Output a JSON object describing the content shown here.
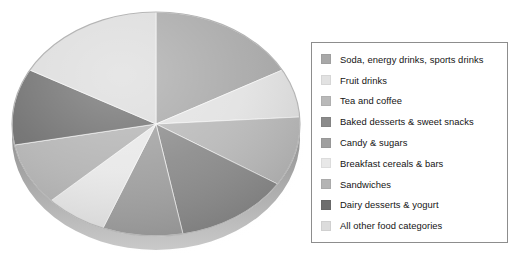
{
  "figure": {
    "background": "#ffffff"
  },
  "legend": {
    "name": "chart-legend",
    "position": "right",
    "border_color": "#8d8d8d",
    "items": [
      {
        "label": "Soda, energy drinks, sports drinks",
        "color": "#a8a8a8"
      },
      {
        "label": "Fruit drinks",
        "color": "#e2e2e2"
      },
      {
        "label": "Tea and coffee",
        "color": "#b9b9b9"
      },
      {
        "label": "Baked desserts & sweet snacks",
        "color": "#8b8b8b"
      },
      {
        "label": "Candy & sugars",
        "color": "#a0a0a0"
      },
      {
        "label": "Breakfast cereals & bars",
        "color": "#e8e8e8"
      },
      {
        "label": "Sandwiches",
        "color": "#b4b4b4"
      },
      {
        "label": "Dairy desserts & yogurt",
        "color": "#6e6e6e"
      },
      {
        "label": "All other food categories",
        "color": "#dcdcdc"
      }
    ]
  },
  "chart_data": {
    "type": "pie",
    "title": "",
    "subtitle": "",
    "xlabel": "",
    "ylabel": "",
    "grid": false,
    "legend_position": "right",
    "style": "3d-pie",
    "labels": [
      "Soda, energy drinks, sports drinks",
      "Fruit drinks",
      "Tea and coffee",
      "Baked desserts & sweet snacks",
      "Candy & sugars",
      "Breakfast cereals & bars",
      "Sandwiches",
      "Dairy desserts & yogurt",
      "All other food categories"
    ],
    "values": [
      17,
      7,
      10,
      13,
      9,
      7,
      9,
      11,
      17
    ],
    "colors": [
      "#a8a8a8",
      "#e2e2e2",
      "#b9b9b9",
      "#8b8b8b",
      "#a0a0a0",
      "#e8e8e8",
      "#b4b4b4",
      "#6e6e6e",
      "#dcdcdc"
    ],
    "start_angle_deg": 0,
    "direction": "clockwise",
    "data_labels_shown": false,
    "units": "percent"
  },
  "pie": {
    "name": "pie-chart",
    "center_x": 156,
    "center_y": 122,
    "radius_x": 144,
    "radius_y": 112,
    "depth_px": 16
  }
}
